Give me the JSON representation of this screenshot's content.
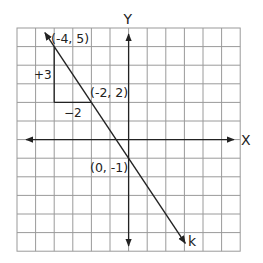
{
  "diagram": {
    "type": "coordinate-plane-line",
    "axes": {
      "x_label": "X",
      "y_label": "Y",
      "x_range": [
        -6,
        6
      ],
      "y_range": [
        -6,
        6
      ],
      "grid_step": 1
    },
    "line": {
      "name": "k",
      "label": "k",
      "slope": -1.5,
      "y_intercept": -1,
      "points": [
        {
          "x": -4,
          "y": 5,
          "label": "(-4, 5)"
        },
        {
          "x": -2,
          "y": 2,
          "label": "(-2, 2)"
        },
        {
          "x": 0,
          "y": -1,
          "label": "(0, -1)"
        }
      ]
    },
    "slope_triangle": {
      "rise_label": "+3",
      "run_label": "−2"
    },
    "colors": {
      "grid": "#9a9a9a",
      "axis": "#222222",
      "line": "#222222",
      "background": "#ffffff"
    }
  }
}
